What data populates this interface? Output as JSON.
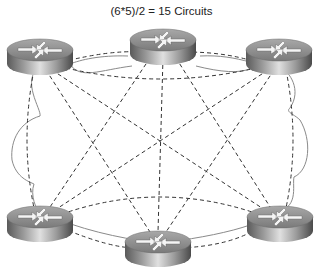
{
  "title": "(6*5)/2 = 15 Circuits",
  "colors": {
    "background": "#ffffff",
    "cloud_outline": "#8a8a8a",
    "circuit_line": "#333333",
    "router_body_dark": "#4a4a4a",
    "router_body_light": "#d8d8d8",
    "router_top": "#8c8c8c",
    "arrow": "#f2f2f2"
  },
  "routers": [
    {
      "id": "router-top-left",
      "cx": 40,
      "cy": 55
    },
    {
      "id": "router-top-center",
      "cx": 163,
      "cy": 45
    },
    {
      "id": "router-top-right",
      "cx": 279,
      "cy": 55
    },
    {
      "id": "router-bottom-left",
      "cx": 40,
      "cy": 222
    },
    {
      "id": "router-bottom-center",
      "cx": 158,
      "cy": 247
    },
    {
      "id": "router-bottom-right",
      "cx": 280,
      "cy": 222
    }
  ],
  "circuit_count": 15,
  "node_count": 6
}
